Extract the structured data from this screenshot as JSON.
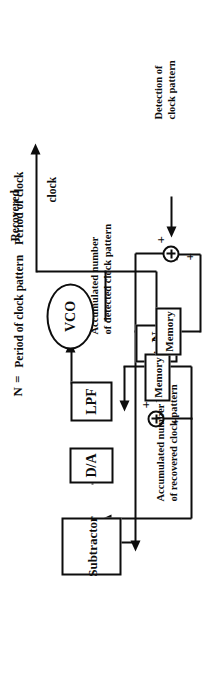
{
  "diagram": {
    "kind": "block-diagram",
    "orientation_degrees": -90,
    "blocks": {
      "vco": "VCO",
      "lpf": "LPF",
      "da": "D/A",
      "subtractor": "Subtractor",
      "divider": "÷ N",
      "memory_recovered": "Memory",
      "memory_detected": "Memory"
    },
    "labels": {
      "recovered_clock_line1": "Recovered",
      "recovered_clock_line2": "clock",
      "accumulated_recovered_line1": "Accumulated number",
      "accumulated_recovered_line2": "of recovered clock pattern",
      "accumulated_detected_line1": "Accumulated number",
      "accumulated_detected_line2": "of detected clock pattern",
      "detection_line1": "Detection of",
      "detection_line2": "clock pattern"
    },
    "formula": {
      "variable": "N",
      "equals": "=",
      "numerator": "Period of clock  pattern",
      "denominator": "Period of clock"
    },
    "signs": {
      "sum_top_a": "+",
      "sum_top_b": "+",
      "sum_bottom_a": "+",
      "sum_bottom_b": "+"
    },
    "colors": {
      "ink": "#0d0d0d",
      "paper": "#ffffff"
    }
  }
}
